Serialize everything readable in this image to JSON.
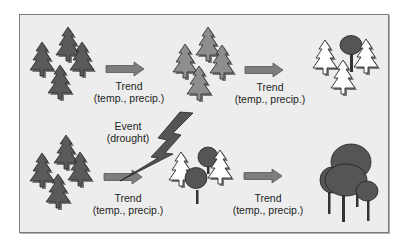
{
  "diagram": {
    "title": "",
    "colors": {
      "background": "#ededed",
      "frame_border": "#7a7a7a",
      "dark_conifer": "#5a5a5a",
      "medium_conifer": "#8e8e8e",
      "light_conifer": "#ffffff",
      "broadleaf": "#555555",
      "arrow": "#7d7d7d",
      "lightning": "#555555"
    },
    "top_row": {
      "stages": [
        {
          "name": "initial-stand",
          "description": "dense dark conifer stand"
        },
        {
          "name": "stressed-stand",
          "description": "lighter conifer stand"
        },
        {
          "name": "transition-stand",
          "description": "white conifers with one broadleaf tree"
        }
      ],
      "arrows": [
        {
          "line1": "Trend",
          "line2": "(temp., precip.)"
        },
        {
          "line1": "Trend",
          "line2": "(temp., precip.)"
        }
      ]
    },
    "bottom_row": {
      "stages": [
        {
          "name": "initial-stand",
          "description": "dense dark conifer stand"
        },
        {
          "name": "disturbed-stand",
          "description": "white conifers with broadleaf trees"
        },
        {
          "name": "broadleaf-stand",
          "description": "broadleaf forest"
        }
      ],
      "event": {
        "line1": "Event",
        "line2": "(drought)"
      },
      "arrows": [
        {
          "line1": "Trend",
          "line2": "(temp., precip.)"
        },
        {
          "line1": "Trend",
          "line2": "(temp., precip.)"
        }
      ]
    }
  }
}
